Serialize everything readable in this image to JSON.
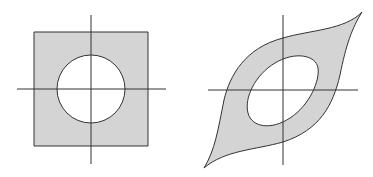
{
  "figure": {
    "colors": {
      "fill": "#d4d4d4",
      "stroke": "#333333",
      "axis": "#333333",
      "background": "#ffffff"
    },
    "left_panel": {
      "name": "square-with-circular-hole"
    },
    "right_panel": {
      "name": "sheared-region-with-elliptical-hole"
    }
  }
}
